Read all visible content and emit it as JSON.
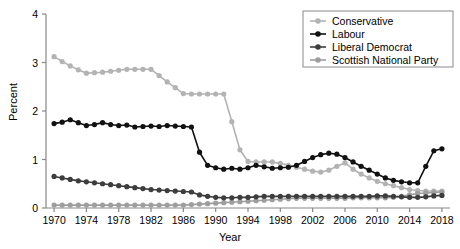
{
  "chart_data": {
    "type": "line",
    "title": "",
    "xlabel": "Year",
    "ylabel": "Percent",
    "xlim": [
      1969,
      2019
    ],
    "ylim": [
      0,
      4
    ],
    "xticks": [
      1970,
      1974,
      1978,
      1982,
      1986,
      1990,
      1994,
      1998,
      2002,
      2006,
      2010,
      2014,
      2018
    ],
    "yticks": [
      0,
      1,
      2,
      3,
      4
    ],
    "grid": false,
    "legend_position": "top-right",
    "markers": "filled-circle",
    "x": [
      1970,
      1971,
      1972,
      1973,
      1974,
      1975,
      1976,
      1977,
      1978,
      1979,
      1980,
      1981,
      1982,
      1983,
      1984,
      1985,
      1986,
      1987,
      1988,
      1989,
      1990,
      1991,
      1992,
      1993,
      1994,
      1995,
      1996,
      1997,
      1998,
      1999,
      2000,
      2001,
      2002,
      2003,
      2004,
      2005,
      2006,
      2007,
      2008,
      2009,
      2010,
      2011,
      2012,
      2013,
      2014,
      2015,
      2016,
      2017,
      2018
    ],
    "series": [
      {
        "name": "Conservative",
        "color": "#b3b3b3",
        "values": [
          3.12,
          3.02,
          2.93,
          2.85,
          2.78,
          2.79,
          2.8,
          2.82,
          2.84,
          2.86,
          2.86,
          2.86,
          2.86,
          2.73,
          2.6,
          2.48,
          2.36,
          2.35,
          2.35,
          2.35,
          2.35,
          2.35,
          1.78,
          1.2,
          0.96,
          0.95,
          0.95,
          0.95,
          0.92,
          0.88,
          0.84,
          0.8,
          0.76,
          0.74,
          0.78,
          0.86,
          0.93,
          0.8,
          0.7,
          0.62,
          0.55,
          0.5,
          0.46,
          0.42,
          0.38,
          0.36,
          0.35,
          0.35,
          0.35
        ]
      },
      {
        "name": "Labour",
        "color": "#111111",
        "values": [
          1.74,
          1.77,
          1.82,
          1.76,
          1.7,
          1.72,
          1.76,
          1.72,
          1.7,
          1.71,
          1.67,
          1.68,
          1.69,
          1.68,
          1.7,
          1.69,
          1.68,
          1.67,
          1.15,
          0.88,
          0.83,
          0.8,
          0.82,
          0.8,
          0.83,
          0.88,
          0.85,
          0.82,
          0.83,
          0.84,
          0.88,
          0.96,
          1.04,
          1.1,
          1.13,
          1.11,
          1.04,
          0.95,
          0.86,
          0.78,
          0.7,
          0.62,
          0.57,
          0.54,
          0.52,
          0.52,
          0.86,
          1.18,
          1.22
        ]
      },
      {
        "name": "Liberal Democrat",
        "color": "#3d3d3d",
        "values": [
          0.65,
          0.62,
          0.59,
          0.56,
          0.54,
          0.52,
          0.5,
          0.48,
          0.46,
          0.44,
          0.42,
          0.4,
          0.38,
          0.37,
          0.36,
          0.35,
          0.34,
          0.33,
          0.27,
          0.24,
          0.22,
          0.21,
          0.21,
          0.22,
          0.22,
          0.23,
          0.24,
          0.24,
          0.24,
          0.24,
          0.24,
          0.24,
          0.24,
          0.24,
          0.24,
          0.24,
          0.24,
          0.24,
          0.24,
          0.24,
          0.25,
          0.25,
          0.24,
          0.23,
          0.22,
          0.22,
          0.23,
          0.25,
          0.26
        ]
      },
      {
        "name": "Scottish National Party",
        "color": "#9e9e9e",
        "values": [
          0.06,
          0.06,
          0.06,
          0.06,
          0.06,
          0.06,
          0.06,
          0.06,
          0.06,
          0.06,
          0.06,
          0.06,
          0.06,
          0.06,
          0.06,
          0.06,
          0.06,
          0.07,
          0.08,
          0.09,
          0.1,
          0.11,
          0.12,
          0.13,
          0.14,
          0.15,
          0.16,
          0.17,
          0.18,
          0.19,
          0.2,
          0.2,
          0.2,
          0.2,
          0.2,
          0.2,
          0.2,
          0.21,
          0.21,
          0.21,
          0.21,
          0.21,
          0.22,
          0.24,
          0.27,
          0.3,
          0.31,
          0.32,
          0.33
        ]
      }
    ]
  },
  "legend": {
    "items": [
      {
        "label": "Conservative"
      },
      {
        "label": "Labour"
      },
      {
        "label": "Liberal Democrat"
      },
      {
        "label": "Scottish National Party"
      }
    ]
  },
  "axes": {
    "x_title": "Year",
    "y_title": "Percent"
  }
}
